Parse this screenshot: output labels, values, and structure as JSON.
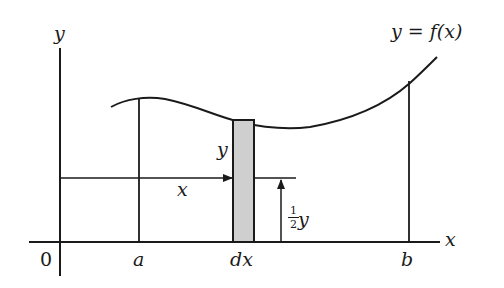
{
  "diagram": {
    "curve_label": "y = f(x)",
    "y_axis_label": "y",
    "x_axis_label": "x",
    "origin_label": "0",
    "a_label": "a",
    "b_label": "b",
    "dx_label": "dx",
    "strip_height_label": "y",
    "distance_label": "x",
    "half_y": {
      "num": "1",
      "den": "2",
      "var": "y"
    },
    "colors": {
      "ink": "#1a1a1a",
      "strip_fill": "#cfcfcf"
    }
  }
}
